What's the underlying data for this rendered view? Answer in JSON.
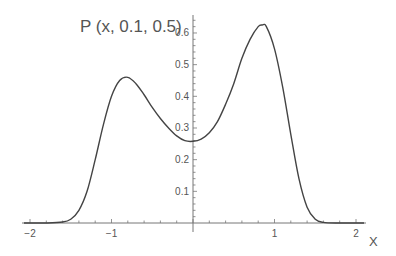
{
  "chart_data": {
    "type": "line",
    "title": "P (x, 0.1, 0.5)",
    "xlabel": "X",
    "ylabel": "",
    "xlim": [
      -2.1,
      2.1
    ],
    "ylim": [
      0,
      0.65
    ],
    "grid": false,
    "legend": null,
    "x_ticks": [
      -2,
      -1,
      0,
      1,
      2
    ],
    "x_tick_labels": [
      "−2",
      "−1",
      "",
      "1",
      "2"
    ],
    "y_ticks": [
      0.1,
      0.2,
      0.3,
      0.4,
      0.5,
      0.6
    ],
    "y_tick_labels": [
      "0.1",
      "0.2",
      "0.3",
      "0.4",
      "0.5",
      "0.6"
    ],
    "series": [
      {
        "name": "P (x, 0.1, 0.5)",
        "x": [
          -2.0,
          -1.8,
          -1.6,
          -1.5,
          -1.4,
          -1.3,
          -1.2,
          -1.1,
          -1.0,
          -0.9,
          -0.8,
          -0.7,
          -0.6,
          -0.5,
          -0.4,
          -0.3,
          -0.2,
          -0.1,
          0.0,
          0.1,
          0.2,
          0.3,
          0.4,
          0.5,
          0.6,
          0.7,
          0.8,
          0.85,
          0.9,
          1.0,
          1.1,
          1.2,
          1.3,
          1.4,
          1.5,
          1.6,
          1.8,
          2.0
        ],
        "y": [
          0.0,
          0.0,
          0.003,
          0.012,
          0.04,
          0.1,
          0.2,
          0.31,
          0.4,
          0.45,
          0.46,
          0.44,
          0.405,
          0.365,
          0.33,
          0.3,
          0.275,
          0.26,
          0.258,
          0.265,
          0.285,
          0.32,
          0.375,
          0.44,
          0.52,
          0.58,
          0.62,
          0.625,
          0.62,
          0.55,
          0.43,
          0.28,
          0.14,
          0.05,
          0.012,
          0.002,
          0.0,
          0.0
        ]
      }
    ]
  },
  "axes": {
    "title_label": "P (x, 0.1, 0.5)",
    "x_axis_label": "X"
  }
}
